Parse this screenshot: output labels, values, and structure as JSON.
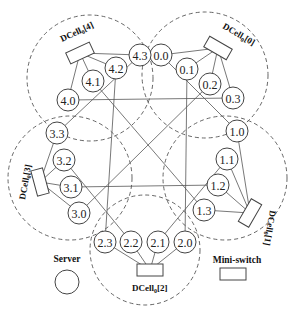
{
  "diagram": {
    "cells": [
      {
        "id": "0",
        "label": "DCell0[0]",
        "label_base": "DCell",
        "label_sub": "0",
        "label_index": "[0]",
        "boundary": {
          "cx": 205,
          "cy": 75,
          "r": 63
        },
        "switch": {
          "x": 218,
          "y": 48,
          "rot": 30
        },
        "label_pos": {
          "x": 222,
          "y": 28,
          "rot": 30
        },
        "servers": [
          {
            "id": "0.0",
            "x": 161,
            "y": 55
          },
          {
            "id": "0.1",
            "x": 187,
            "y": 69
          },
          {
            "id": "0.2",
            "x": 210,
            "y": 84
          },
          {
            "id": "0.3",
            "x": 233,
            "y": 98
          }
        ]
      },
      {
        "id": "1",
        "label": "DCell0[1]",
        "label_base": "DCell",
        "label_sub": "0",
        "label_index": "[1]",
        "boundary": {
          "cx": 225,
          "cy": 178,
          "r": 62
        },
        "switch": {
          "x": 250,
          "y": 213,
          "rot": -60
        },
        "label_pos": {
          "x": 270,
          "y": 210,
          "rot": 100
        },
        "servers": [
          {
            "id": "1.0",
            "x": 237,
            "y": 131
          },
          {
            "id": "1.1",
            "x": 227,
            "y": 159
          },
          {
            "id": "1.2",
            "x": 218,
            "y": 185
          },
          {
            "id": "1.3",
            "x": 204,
            "y": 210
          }
        ]
      },
      {
        "id": "2",
        "label": "DCell0[2]",
        "label_base": "DCell",
        "label_sub": "0",
        "label_index": "[2]",
        "boundary": {
          "cx": 145,
          "cy": 250,
          "r": 55
        },
        "switch": {
          "x": 150,
          "y": 270,
          "rot": 0
        },
        "label_pos": {
          "x": 132,
          "y": 291,
          "rot": 0
        },
        "servers": [
          {
            "id": "2.3",
            "x": 105,
            "y": 242
          },
          {
            "id": "2.2",
            "x": 131,
            "y": 242
          },
          {
            "id": "2.1",
            "x": 158,
            "y": 242
          },
          {
            "id": "2.0",
            "x": 185,
            "y": 242
          }
        ]
      },
      {
        "id": "3",
        "label": "DCell0[3]",
        "label_base": "DCell",
        "label_sub": "0",
        "label_index": "[3]",
        "boundary": {
          "cx": 70,
          "cy": 178,
          "r": 62
        },
        "switch": {
          "x": 40,
          "y": 182,
          "rot": 75
        },
        "label_pos": {
          "x": 25,
          "y": 200,
          "rot": -80
        },
        "servers": [
          {
            "id": "3.3",
            "x": 57,
            "y": 133
          },
          {
            "id": "3.2",
            "x": 64,
            "y": 160
          },
          {
            "id": "3.1",
            "x": 71,
            "y": 187
          },
          {
            "id": "3.0",
            "x": 79,
            "y": 213
          }
        ]
      },
      {
        "id": "4",
        "label": "DCell0[4]",
        "label_base": "DCell",
        "label_sub": "0",
        "label_index": "[4]",
        "boundary": {
          "cx": 90,
          "cy": 78,
          "r": 63
        },
        "switch": {
          "x": 80,
          "y": 53,
          "rot": -25
        },
        "label_pos": {
          "x": 62,
          "y": 42,
          "rot": -25
        },
        "servers": [
          {
            "id": "4.0",
            "x": 68,
            "y": 100
          },
          {
            "id": "4.1",
            "x": 93,
            "y": 81
          },
          {
            "id": "4.2",
            "x": 116,
            "y": 68
          },
          {
            "id": "4.3",
            "x": 140,
            "y": 55
          }
        ]
      }
    ],
    "inter_cell_links": [
      [
        "0.0",
        "1.0"
      ],
      [
        "0.1",
        "2.0"
      ],
      [
        "0.2",
        "3.0"
      ],
      [
        "0.3",
        "4.0"
      ],
      [
        "1.1",
        "2.1"
      ],
      [
        "1.2",
        "3.1"
      ],
      [
        "1.3",
        "4.1"
      ],
      [
        "2.2",
        "3.2"
      ],
      [
        "2.3",
        "4.2"
      ],
      [
        "3.3",
        "4.3"
      ]
    ],
    "legend": {
      "server_label": "Server",
      "switch_label": "Mini-switch"
    }
  }
}
